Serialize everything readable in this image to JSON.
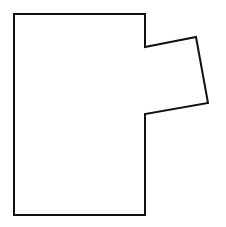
{
  "diagram": {
    "type": "polygon-outline",
    "stroke_color": "#111111",
    "fill_color": "#ffffff",
    "stroke_width": 2,
    "vertices": [
      [
        14,
        14
      ],
      [
        145,
        14
      ],
      [
        145,
        47
      ],
      [
        196,
        37
      ],
      [
        208,
        103
      ],
      [
        145,
        114
      ],
      [
        145,
        215
      ],
      [
        14,
        215
      ]
    ]
  }
}
